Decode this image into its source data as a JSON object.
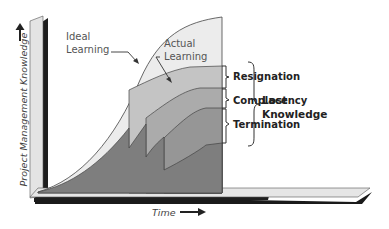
{
  "diagram": {
    "type": "layered-area-learning-curve",
    "axes": {
      "y_label": "Project Management Knowledge",
      "x_label": "Time"
    },
    "curves": {
      "ideal_label_line1": "Ideal",
      "ideal_label_line2": "Learning",
      "actual_label_line1": "Actual",
      "actual_label_line2": "Learning"
    },
    "loss_causes": [
      {
        "label": "Resignation"
      },
      {
        "label": "Complacency"
      },
      {
        "label": "Termination"
      }
    ],
    "summary": {
      "line1": "Lost",
      "line2": "Knowledge"
    },
    "colors": {
      "ideal_fill": "#ececec",
      "layer1_fill": "#c4c4c4",
      "layer2_fill": "#ababab",
      "layer3_fill": "#969696",
      "actual_fill": "#7e7e7e",
      "outline": "#444444",
      "axis_dark": "#1e1e1e",
      "axis_light": "#e4e4e4"
    }
  }
}
